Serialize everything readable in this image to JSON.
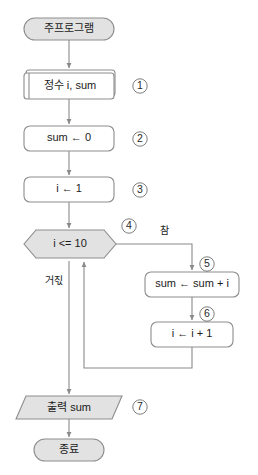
{
  "diagram": {
    "type": "flowchart",
    "language": "ko",
    "colors": {
      "terminal_fill": "#e2e2e2",
      "process_fill": "#ffffff",
      "stroke": "#8d8d8d",
      "text": "#1b1b1b"
    }
  },
  "nodes": {
    "start": {
      "label": "주프로그램",
      "shape": "terminal"
    },
    "declare": {
      "label": "정수 i, sum",
      "shape": "declaration",
      "marker": "①"
    },
    "init_sum": {
      "label": "sum ← 0",
      "shape": "process",
      "marker": "②"
    },
    "init_i": {
      "label": "i ← 1",
      "shape": "process",
      "marker": "③"
    },
    "condition": {
      "label": "i <= 10",
      "shape": "decision",
      "marker": "④"
    },
    "accumulate": {
      "label": "sum ← sum + i",
      "shape": "process",
      "marker": "⑤"
    },
    "increment": {
      "label": "i ← i + 1",
      "shape": "process",
      "marker": "⑥"
    },
    "output": {
      "label": "출력 sum",
      "shape": "io-parallelogram",
      "marker": "⑦"
    },
    "end": {
      "label": "종료",
      "shape": "terminal"
    }
  },
  "branch_labels": {
    "true": "참",
    "false": "거짃"
  }
}
